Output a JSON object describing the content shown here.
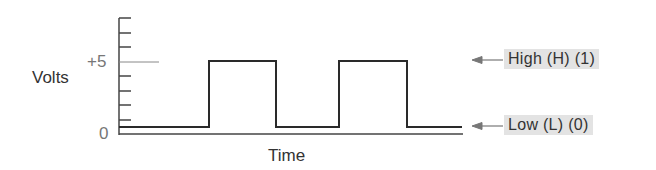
{
  "diagram": {
    "y_axis": {
      "label": "Volts",
      "ticks": [
        "+5",
        "0"
      ]
    },
    "x_axis": {
      "label": "Time"
    },
    "levels": [
      {
        "name": "high",
        "text": "High (H) (1)",
        "volts": 5
      },
      {
        "name": "low",
        "text": "Low (L) (0)",
        "volts": 0
      }
    ],
    "waveform": {
      "type": "square",
      "sequence": [
        "low",
        "high",
        "low",
        "high",
        "low"
      ]
    },
    "colors": {
      "line": "#2a2a2a",
      "tag_bg": "#e3e3e3",
      "arrow": "#777777"
    }
  }
}
